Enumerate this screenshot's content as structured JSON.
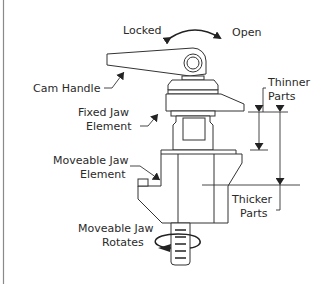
{
  "diagram": {
    "type": "mechanical-illustration",
    "labels": {
      "locked": "Locked",
      "open": "Open",
      "cam_handle": "Cam Handle",
      "fixed_jaw_line1": "Fixed Jaw",
      "fixed_jaw_line2": "Element",
      "moveable_jaw_line1": "Moveable Jaw",
      "moveable_jaw_line2": "Element",
      "thinner_line1": "Thinner",
      "thinner_line2": "Parts",
      "thicker_line1": "Thicker",
      "thicker_line2": "Parts",
      "rotates_line1": "Moveable Jaw",
      "rotates_line2": "Rotates"
    },
    "colors": {
      "line": "#333333",
      "text": "#2a2a2a",
      "border": "#8a8a8a",
      "background": "#ffffff"
    }
  }
}
